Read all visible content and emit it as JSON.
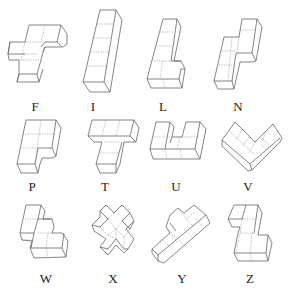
{
  "figure": {
    "rows": [
      {
        "pieces": [
          {
            "letter": "F"
          },
          {
            "letter": "I"
          },
          {
            "letter": "L"
          },
          {
            "letter": "N"
          }
        ]
      },
      {
        "pieces": [
          {
            "letter": "P"
          },
          {
            "letter": "T"
          },
          {
            "letter": "U"
          },
          {
            "letter": "V"
          }
        ]
      },
      {
        "pieces": [
          {
            "letter": "W"
          },
          {
            "letter": "X"
          },
          {
            "letter": "Y"
          },
          {
            "letter": "Z"
          }
        ]
      }
    ]
  },
  "colors": {
    "line": "#666666",
    "hidden_line": "#888888",
    "label": "#222222",
    "background": "#ffffff"
  }
}
